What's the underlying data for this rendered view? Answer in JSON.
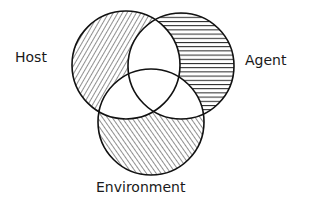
{
  "diagram": {
    "type": "venn",
    "sets": [
      {
        "id": "host",
        "label": "Host",
        "hatch": "diagonal-right",
        "cx": 126,
        "cy": 65,
        "r": 54
      },
      {
        "id": "agent",
        "label": "Agent",
        "hatch": "horizontal",
        "cx": 181,
        "cy": 66,
        "r": 53
      },
      {
        "id": "environment",
        "label": "Environment",
        "hatch": "diagonal-left",
        "cx": 151,
        "cy": 122,
        "r": 53
      }
    ],
    "colors": {
      "stroke": "#111111",
      "background": "#ffffff"
    }
  }
}
